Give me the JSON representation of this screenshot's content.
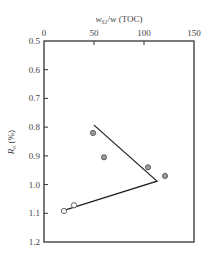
{
  "chart_data": {
    "type": "scatter",
    "title": "",
    "xlabel": "w_S1/w (TOC)",
    "xlabel_main": "w",
    "xlabel_sub": "S1",
    "xlabel_rest": "/w (TOC)",
    "ylabel": "R_o (%)",
    "ylabel_main": "R",
    "ylabel_sub": "o",
    "ylabel_rest": " (%)",
    "x_axis_position": "top",
    "y_axis_inverted": true,
    "xlim": [
      0,
      150
    ],
    "ylim": [
      0.5,
      1.2
    ],
    "xticks": [
      0,
      50,
      100,
      150
    ],
    "xtick_labels": [
      "0",
      "50",
      "100",
      "150"
    ],
    "yticks": [
      0.5,
      0.6,
      0.7,
      0.8,
      0.9,
      1.0,
      1.1,
      1.2
    ],
    "ytick_labels": [
      "0.5",
      "0.6",
      "0.7",
      "0.8",
      "0.9",
      "1.0",
      "1.1",
      "1.2"
    ],
    "grid": false,
    "legend": null,
    "series": [
      {
        "name": "filled points",
        "marker": "circle-filled",
        "color": "#9a9a9a",
        "points": [
          {
            "x": 49,
            "y": 0.82
          },
          {
            "x": 60,
            "y": 0.905
          },
          {
            "x": 104,
            "y": 0.94
          },
          {
            "x": 121,
            "y": 0.97
          }
        ]
      },
      {
        "name": "open points",
        "marker": "circle-open",
        "color": "#ffffff",
        "points": [
          {
            "x": 20,
            "y": 1.092
          },
          {
            "x": 30,
            "y": 1.072
          }
        ]
      },
      {
        "name": "trend line",
        "marker": "line",
        "color": "#222222",
        "points": [
          {
            "x": 50,
            "y": 0.793
          },
          {
            "x": 113,
            "y": 0.988
          },
          {
            "x": 20,
            "y": 1.09
          }
        ]
      }
    ]
  }
}
